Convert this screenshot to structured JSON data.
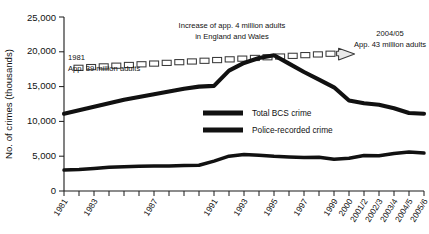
{
  "chart_data": {
    "type": "line",
    "title": "",
    "xlabel": "",
    "ylabel": "No. of crimes (thousands)",
    "ylim": [
      0,
      25000
    ],
    "yticks": [
      0,
      5000,
      10000,
      15000,
      20000,
      25000
    ],
    "ytick_labels": [
      "0",
      "5,000",
      "10,000",
      "15,000",
      "20,000",
      "25,000"
    ],
    "grid": false,
    "legend_position": "center",
    "categories": [
      "1981",
      "1982",
      "1983",
      "1984",
      "1985",
      "1986",
      "1987",
      "1988",
      "1989",
      "1990",
      "1991",
      "1992",
      "1993",
      "1994",
      "1995",
      "1996",
      "1997",
      "1998",
      "1999",
      "2000",
      "2001/2",
      "2002/3",
      "2003/4",
      "2004/5",
      "2005/6"
    ],
    "xtick_labels": [
      "1981",
      "1983",
      "1987",
      "1991",
      "1993",
      "1995",
      "1997",
      "1999",
      "2000",
      "2001/2",
      "2002/3",
      "2003/4",
      "2004/5",
      "2005/6"
    ],
    "series": [
      {
        "name": "Total BCS crime",
        "values": [
          11100,
          11600,
          12100,
          12600,
          13100,
          13500,
          13900,
          14300,
          14700,
          15000,
          15100,
          17300,
          18400,
          19100,
          19500,
          18300,
          17100,
          16000,
          14900,
          13000,
          12600,
          12400,
          11900,
          11200,
          11100
        ]
      },
      {
        "name": "Police-recorded crime",
        "values": [
          3000,
          3100,
          3250,
          3400,
          3500,
          3550,
          3600,
          3600,
          3650,
          3700,
          4300,
          5000,
          5250,
          5150,
          5000,
          4900,
          4800,
          4850,
          4550,
          4700,
          5100,
          5050,
          5400,
          5600,
          5450
        ]
      }
    ],
    "annotations": [
      {
        "name": "start-population",
        "lines": [
          "1981",
          "App. 39 million adults"
        ]
      },
      {
        "name": "increase-population",
        "lines": [
          "Increase of app. 4 million adults",
          "in England and Wales"
        ]
      },
      {
        "name": "end-population",
        "lines": [
          "2004/05",
          "App. 43 million adults"
        ]
      }
    ],
    "population_band": {
      "name": "adult-population-trend",
      "style": "dashed-arrow",
      "start_value": 17700,
      "end_value": 19900
    }
  },
  "legend": {
    "items": [
      {
        "label": "Total BCS crime",
        "swatch": "thick-dashed-bar"
      },
      {
        "label": "Police-recorded crime",
        "swatch": "thick-solid-bar"
      }
    ]
  }
}
